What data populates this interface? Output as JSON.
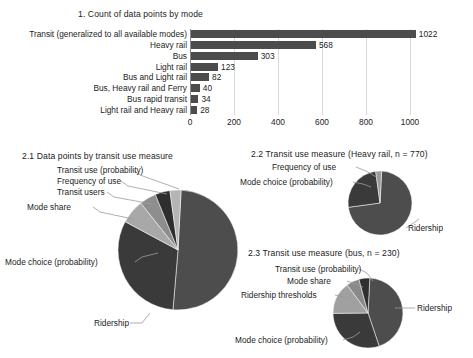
{
  "chart_data": [
    {
      "type": "bar",
      "id": "fig1",
      "title": "1. Count of data points by mode",
      "orientation": "horizontal",
      "categories": [
        "Transit (generalized to all available modes)",
        "Heavy rail",
        "Bus",
        "Light rail",
        "Bus and Light rail",
        "Bus, Heavy rail and Ferry",
        "Bus rapid transit",
        "Light rail and Heavy rail"
      ],
      "values": [
        1022,
        568,
        303,
        123,
        82,
        40,
        34,
        28
      ],
      "value_labels": [
        "1022",
        "568",
        "303",
        "123",
        "82",
        "40",
        "34",
        "28"
      ],
      "xlabel": "",
      "ylabel": "",
      "xlim": [
        0,
        1100
      ],
      "xticks": [
        0,
        200,
        400,
        600,
        800,
        1000
      ],
      "xtick_labels": [
        "0",
        "200",
        "400",
        "600",
        "800",
        "1000"
      ],
      "grid": true,
      "bar_color": "#4c4c4c"
    },
    {
      "type": "pie",
      "id": "fig21",
      "title": "2.1 Data points by transit use measure",
      "labels": [
        "Ridership",
        "Mode choice (probability)",
        "Mode share",
        "Transit users",
        "Frequency of use",
        "Transit use (probability)"
      ],
      "values": [
        50.5,
        31.5,
        6.5,
        4.5,
        4.0,
        3.0
      ],
      "colors": [
        "#4d4d4d",
        "#3a3a3a",
        "#a8a8a8",
        "#8e8e8e",
        "#2e2e2e",
        "#b5b5b5"
      ]
    },
    {
      "type": "pie",
      "id": "fig22",
      "title": "2.2 Transit use measure (Heavy rail, n = 770)",
      "labels": [
        "Ridership",
        "Mode choice (probability)",
        "Frequency of use"
      ],
      "values": [
        72.0,
        25.0,
        3.0
      ],
      "colors": [
        "#4d4d4d",
        "#3a3a3a",
        "#9c9c9c"
      ]
    },
    {
      "type": "pie",
      "id": "fig23",
      "title": "2.3 Transit use measure (bus, n = 230)",
      "labels": [
        "Ridership",
        "Mode choice (probability)",
        "Ridership thresholds",
        "Mode share",
        "Transit use (probability)"
      ],
      "values": [
        44.0,
        30.0,
        15.0,
        6.0,
        5.0
      ],
      "colors": [
        "#4d4d4d",
        "#3a3a3a",
        "#a0a0a0",
        "#8a8a8a",
        "#2f2f2f"
      ]
    }
  ],
  "fig1": {
    "title": "1. Count of data points by mode",
    "bars": [
      {
        "label": "Transit (generalized to all available modes)",
        "value": 1022,
        "value_text": "1022"
      },
      {
        "label": "Heavy rail",
        "value": 568,
        "value_text": "568"
      },
      {
        "label": "Bus",
        "value": 303,
        "value_text": "303"
      },
      {
        "label": "Light rail",
        "value": 123,
        "value_text": "123"
      },
      {
        "label": "Bus and Light rail",
        "value": 82,
        "value_text": "82"
      },
      {
        "label": "Bus, Heavy rail and Ferry",
        "value": 40,
        "value_text": "40"
      },
      {
        "label": "Bus rapid transit",
        "value": 34,
        "value_text": "34"
      },
      {
        "label": "Light rail and Heavy rail",
        "value": 28,
        "value_text": "28"
      }
    ],
    "xtick_labels": [
      "0",
      "200",
      "400",
      "600",
      "800",
      "1000"
    ]
  },
  "fig21": {
    "title": "2.1 Data points by transit use measure",
    "labels": {
      "transit_use_probability": "Transit use (probability)",
      "frequency_of_use": "Frequency of use",
      "transit_users": "Transit users",
      "mode_share": "Mode share",
      "mode_choice_probability": "Mode choice (probability)",
      "ridership": "Ridership"
    }
  },
  "fig22": {
    "title": "2.2 Transit use measure (Heavy rail, n = 770)",
    "labels": {
      "frequency_of_use": "Frequency of use",
      "mode_choice_probability": "Mode choice (probability)",
      "ridership": "Ridership"
    }
  },
  "fig23": {
    "title": "2.3 Transit use measure (bus, n = 230)",
    "labels": {
      "transit_use_probability": "Transit use (probability)",
      "mode_share": "Mode share",
      "ridership_thresholds": "Ridership thresholds",
      "mode_choice_probability": "Mode choice (probability)",
      "ridership": "Ridership"
    }
  }
}
